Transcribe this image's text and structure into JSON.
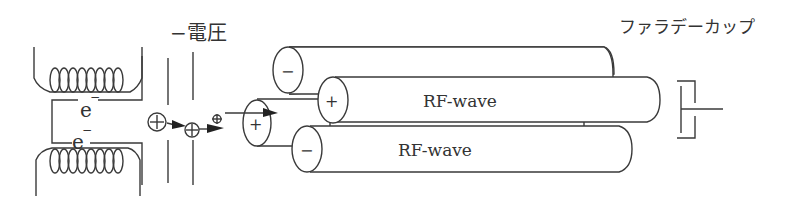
{
  "diagram": {
    "voltage_label": "−電圧",
    "faraday_cup_label": "ファラデーカップ",
    "electron_labels": [
      "e",
      "e"
    ],
    "electron_charge": "−",
    "rod_labels": {
      "top_rod_sign": "−",
      "middle_rod_sign": "+",
      "bottom_rod_sign": "−",
      "entrance_rod_sign": "+"
    },
    "rf_labels": [
      "RF-wave",
      "RF-wave"
    ],
    "ion_sign": "+"
  },
  "colors": {
    "line": "#3a3a3a",
    "background": "#ffffff"
  }
}
